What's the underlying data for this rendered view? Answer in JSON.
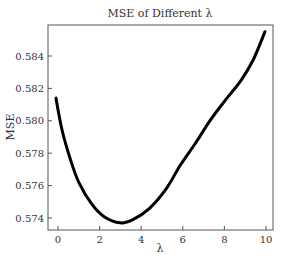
{
  "chart_data": {
    "type": "line",
    "title": "MSE of Different λ",
    "xlabel": "λ",
    "ylabel": "MSE",
    "xlim": [
      -0.3,
      10.3
    ],
    "ylim": [
      0.5733,
      0.586
    ],
    "xticks": [
      0,
      2,
      4,
      6,
      8,
      10
    ],
    "xtick_labels": [
      "0",
      "2",
      "4",
      "6",
      "8",
      "10"
    ],
    "yticks": [
      0.574,
      0.576,
      0.578,
      0.58,
      0.582,
      0.584
    ],
    "ytick_labels": [
      "0.574",
      "0.576",
      "0.578",
      "0.580",
      "0.582",
      "0.584"
    ],
    "grid": false,
    "legend": null,
    "series": [
      {
        "name": "MSE",
        "color": "#000000",
        "x": [
          -0.1,
          0.2,
          0.6,
          1.0,
          1.6,
          2.2,
          3.0,
          3.6,
          4.4,
          5.2,
          5.9,
          6.6,
          7.3,
          8.0,
          8.8,
          9.4,
          9.95
        ],
        "y": [
          0.5814,
          0.5794,
          0.5776,
          0.5762,
          0.5749,
          0.5741,
          0.5737,
          0.5739,
          0.5746,
          0.5758,
          0.5773,
          0.5786,
          0.58,
          0.5812,
          0.5825,
          0.5838,
          0.5855
        ]
      }
    ]
  }
}
